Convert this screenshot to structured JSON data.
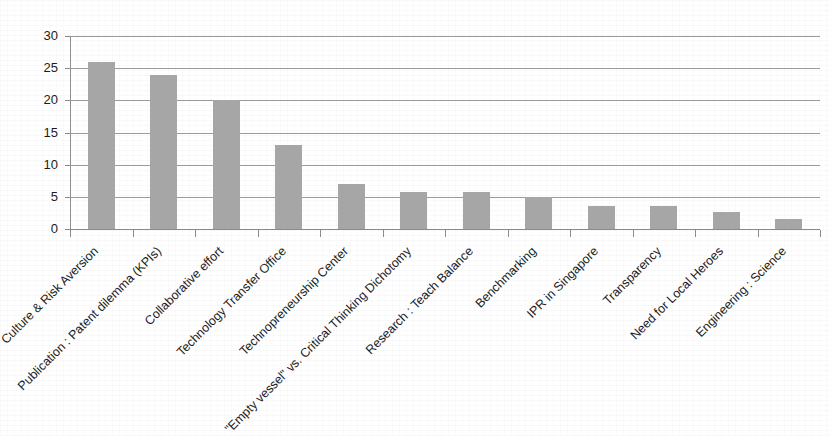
{
  "chart_data": {
    "type": "bar",
    "title": "",
    "subtitle": "",
    "xlabel": "",
    "ylabel": "",
    "ylim": [
      0,
      30
    ],
    "y_ticks": [
      0,
      5,
      10,
      15,
      20,
      25,
      30
    ],
    "y_tick_labels": [
      "0",
      "5",
      "10",
      "15",
      "20",
      "25",
      "30"
    ],
    "grid": true,
    "legend": false,
    "legend_position": "none",
    "bar_color": "#a6a6a6",
    "axis_color": "#8a8a8a",
    "x_tick_label_rotation": -45,
    "categories": [
      "Culture & Risk Aversion",
      "Publication : Patent dilemma (KPIs)",
      "Collaborative effort",
      "Technology Transfer Office",
      "Technopreneurship Center",
      "\"Empty vessel\" vs. Critical Thinking Dichotomy",
      "Research : Teach Balance",
      "Benchmarking",
      "IPR in Singapore",
      "Transparency",
      "Need for Local Heroes",
      "Engineering : Science"
    ],
    "values": [
      26,
      24,
      20,
      13,
      7,
      5.7,
      5.7,
      5,
      3.6,
      3.5,
      2.7,
      1.6
    ]
  }
}
